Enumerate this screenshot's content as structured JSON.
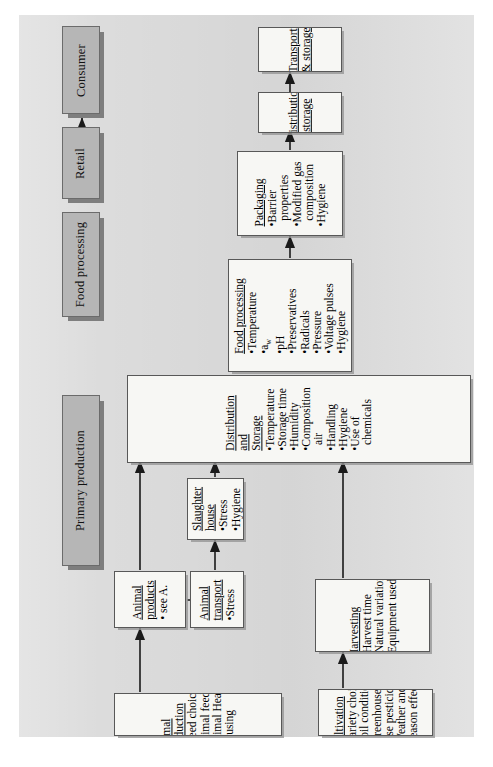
{
  "diagram": {
    "orientation": "rotated-90-ccw",
    "colors": {
      "panel_bg": "#dcdcdc",
      "band_fill": "#b6b6b6",
      "band_border": "#6b6b6b",
      "box_fill": "#f7f7f4",
      "box_border": "#585858",
      "arrow": "#1a1a1a"
    }
  },
  "stages": [
    {
      "id": "primary-production",
      "label": "Primary production"
    },
    {
      "id": "food-processing",
      "label": "Food processing"
    },
    {
      "id": "retail",
      "label": "Retail"
    },
    {
      "id": "consumer",
      "label": "Consumer"
    }
  ],
  "boxes": [
    {
      "id": "animal-production",
      "title_lines": [
        "Animal",
        "production"
      ],
      "bullets": [
        "•Breed choice",
        "•Animal feeding",
        "•Animal Health",
        "•Housing"
      ]
    },
    {
      "id": "animal-products",
      "title_lines": [
        "Animal",
        "products"
      ],
      "bullets": [
        "• see A."
      ]
    },
    {
      "id": "animal-transport",
      "title_lines": [
        "Animal",
        "transport"
      ],
      "bullets": [
        "•Stress"
      ]
    },
    {
      "id": "slaughter-house",
      "title_lines": [
        "Slaughter",
        "house"
      ],
      "bullets": [
        "•Stress",
        "•Hygiene"
      ]
    },
    {
      "id": "cultivation",
      "title_lines": [
        "Cultivation"
      ],
      "bullets": [
        "•Variety choice",
        "•Soil condition",
        "•Greenhouse c.",
        "•Use pesticides",
        "•Weather and",
        "  season effects"
      ]
    },
    {
      "id": "harvesting",
      "title_lines": [
        "Harvesting"
      ],
      "bullets": [
        "•Harvest time",
        "•Natural variation",
        "•Equipment used"
      ]
    },
    {
      "id": "distribution-and-storage",
      "title_lines": [
        "Distribution",
        "and",
        "Storage"
      ],
      "bullets": [
        "•Temperature",
        "•Storage time",
        "•Humidity",
        "•Composition",
        "  air",
        "•Handling",
        "•Hygiene",
        "•Use of",
        "  chemicals"
      ]
    },
    {
      "id": "food-processing-detail",
      "title_lines": [
        "Food processing"
      ],
      "bullets": [
        "•Temperature",
        "•a",
        "•pH",
        "•Preservatives",
        "•Radicals",
        "•Pressure",
        "•Voltage pulses",
        "•Hygiene"
      ],
      "subscript_note": "w"
    },
    {
      "id": "packaging",
      "title_lines": [
        "Packaging"
      ],
      "bullets": [
        "•Barrier",
        "  properties",
        "•Modified gas",
        "  composition",
        "•Hygiene"
      ]
    },
    {
      "id": "distribution-storage-2",
      "title_lines": [
        "Distribution",
        "&storage"
      ],
      "bullets": []
    },
    {
      "id": "transport-storage",
      "title_lines": [
        "Transport",
        "& storage"
      ],
      "bullets": []
    }
  ],
  "flows": [
    {
      "from": "primary-production",
      "to": "food-processing"
    },
    {
      "from": "food-processing",
      "to": "retail"
    },
    {
      "from": "retail",
      "to": "consumer"
    },
    {
      "from": "animal-production",
      "to": "animal-products"
    },
    {
      "from": "animal-products",
      "to": "animal-transport"
    },
    {
      "from": "animal-products",
      "to": "distribution-and-storage"
    },
    {
      "from": "animal-transport",
      "to": "slaughter-house"
    },
    {
      "from": "slaughter-house",
      "to": "distribution-and-storage"
    },
    {
      "from": "cultivation",
      "to": "harvesting"
    },
    {
      "from": "harvesting",
      "to": "distribution-and-storage"
    },
    {
      "from": "distribution-and-storage",
      "to": "food-processing-detail"
    },
    {
      "from": "food-processing-detail",
      "to": "packaging"
    },
    {
      "from": "packaging",
      "to": "distribution-storage-2"
    },
    {
      "from": "distribution-storage-2",
      "to": "transport-storage"
    }
  ]
}
